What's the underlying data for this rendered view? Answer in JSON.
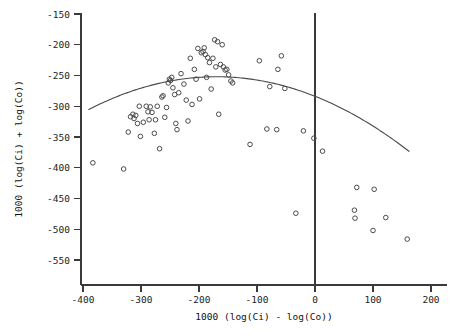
{
  "chart_data": {
    "type": "scatter",
    "title": "",
    "xlabel": "1000 (log(Ci) - log(Co))",
    "ylabel": "1000 (log(Ci) + log(Co))",
    "xlim": [
      -420,
      215
    ],
    "ylim": [
      -575,
      -140
    ],
    "xticks": [
      -400,
      -300,
      -200,
      -100,
      0,
      100,
      200
    ],
    "xticklabels": [
      "-400",
      "-300",
      "-200",
      "-100",
      "0",
      "100",
      "200"
    ],
    "yticks": [
      -150,
      -200,
      -250,
      -300,
      -350,
      -400,
      -450,
      -500,
      -550
    ],
    "yticklabels": [
      "-150",
      "-200",
      "-250",
      "-300",
      "-350",
      "-400",
      "-450",
      "-500",
      "-550"
    ],
    "grid": false,
    "legend": null,
    "marker_style": "open-circle",
    "marker_color": "#4b4b4b",
    "curve_color": "#4a4a4a",
    "axis_color": "#3a3a3a",
    "annotations": [
      {
        "name": "vertical-reference-line",
        "type": "vline",
        "x": 0
      }
    ],
    "series": [
      {
        "name": "observations",
        "type": "scatter",
        "points": [
          [
            -383,
            -392
          ],
          [
            -330,
            -402
          ],
          [
            -322,
            -342
          ],
          [
            -318,
            -317
          ],
          [
            -314,
            -313
          ],
          [
            -312,
            -320
          ],
          [
            -309,
            -315
          ],
          [
            -306,
            -328
          ],
          [
            -303,
            -300
          ],
          [
            -301,
            -349
          ],
          [
            -296,
            -326
          ],
          [
            -291,
            -300
          ],
          [
            -288,
            -309
          ],
          [
            -286,
            -322
          ],
          [
            -284,
            -301
          ],
          [
            -281,
            -310
          ],
          [
            -277,
            -344
          ],
          [
            -275,
            -322
          ],
          [
            -272,
            -300
          ],
          [
            -268,
            -369
          ],
          [
            -264,
            -285
          ],
          [
            -262,
            -283
          ],
          [
            -259,
            -318
          ],
          [
            -256,
            -302
          ],
          [
            -253,
            -262
          ],
          [
            -251,
            -256
          ],
          [
            -249,
            -258
          ],
          [
            -247,
            -253
          ],
          [
            -245,
            -270
          ],
          [
            -242,
            -281
          ],
          [
            -240,
            -328
          ],
          [
            -238,
            -338
          ],
          [
            -235,
            -278
          ],
          [
            -231,
            -247
          ],
          [
            -226,
            -264
          ],
          [
            -222,
            -290
          ],
          [
            -219,
            -324
          ],
          [
            -215,
            -222
          ],
          [
            -212,
            -297
          ],
          [
            -208,
            -240
          ],
          [
            -205,
            -256
          ],
          [
            -202,
            -206
          ],
          [
            -199,
            -288
          ],
          [
            -196,
            -213
          ],
          [
            -193,
            -211
          ],
          [
            -191,
            -205
          ],
          [
            -189,
            -216
          ],
          [
            -187,
            -253
          ],
          [
            -185,
            -221
          ],
          [
            -182,
            -229
          ],
          [
            -179,
            -272
          ],
          [
            -176,
            -222
          ],
          [
            -173,
            -192
          ],
          [
            -171,
            -236
          ],
          [
            -168,
            -195
          ],
          [
            -166,
            -313
          ],
          [
            -163,
            -232
          ],
          [
            -160,
            -200
          ],
          [
            -158,
            -236
          ],
          [
            -155,
            -241
          ],
          [
            -152,
            -240
          ],
          [
            -149,
            -249
          ],
          [
            -145,
            -259
          ],
          [
            -142,
            -262
          ],
          [
            -112,
            -362
          ],
          [
            -96,
            -226
          ],
          [
            -83,
            -337
          ],
          [
            -78,
            -268
          ],
          [
            -66,
            -338
          ],
          [
            -64,
            -240
          ],
          [
            -58,
            -218
          ],
          [
            -52,
            -271
          ],
          [
            -33,
            -474
          ],
          [
            -20,
            -340
          ],
          [
            -2,
            -352
          ],
          [
            13,
            -373
          ],
          [
            68,
            -469
          ],
          [
            69,
            -482
          ],
          [
            72,
            -432
          ],
          [
            100,
            -502
          ],
          [
            102,
            -435
          ],
          [
            122,
            -481
          ],
          [
            159,
            -516
          ]
        ]
      },
      {
        "name": "quadratic-fit",
        "type": "line",
        "description": "fitted downward-opening parabola",
        "vertex": [
          -170,
          -252
        ],
        "x_range": [
          -390,
          162
        ],
        "coefficients": {
          "a": -0.0011,
          "h": -170,
          "k": -252
        }
      }
    ]
  },
  "axis": {
    "x_title": "1000 (log(Ci) - log(Co))",
    "y_title": "1000 (log(Ci) + log(Co))"
  }
}
